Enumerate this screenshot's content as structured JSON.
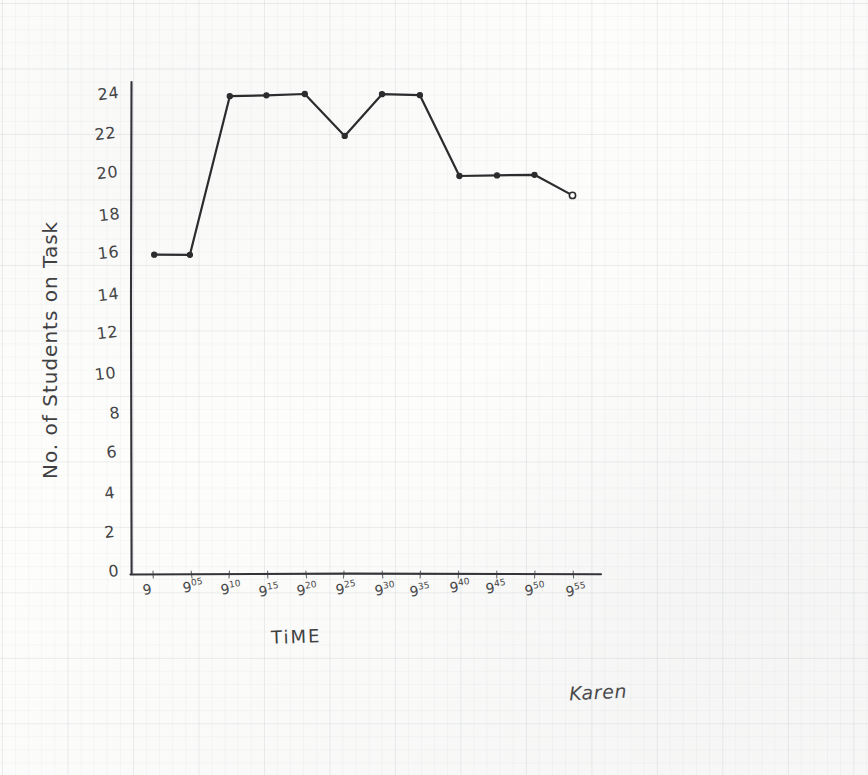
{
  "document": {
    "kind": "hand-drawn-graph-on-graph-paper",
    "signature": "Karen",
    "ink_color": "#2c2c2e",
    "paper_color": "#fdfdfc"
  },
  "chart_data": {
    "type": "line",
    "title": "",
    "xlabel": "TiME",
    "ylabel": "No. of Students on Task",
    "categories": [
      "9",
      "9:05",
      "9:10",
      "9:15",
      "9:20",
      "9:25",
      "9:30",
      "9:35",
      "9:40",
      "9:45",
      "9:50",
      "9:55"
    ],
    "x_tick_labels": [
      {
        "base": "9",
        "sup": ""
      },
      {
        "base": "9",
        "sup": "05"
      },
      {
        "base": "9",
        "sup": "10"
      },
      {
        "base": "9",
        "sup": "15"
      },
      {
        "base": "9",
        "sup": "20"
      },
      {
        "base": "9",
        "sup": "25"
      },
      {
        "base": "9",
        "sup": "30"
      },
      {
        "base": "9",
        "sup": "35"
      },
      {
        "base": "9",
        "sup": "40"
      },
      {
        "base": "9",
        "sup": "45"
      },
      {
        "base": "9",
        "sup": "50"
      },
      {
        "base": "9",
        "sup": "55"
      }
    ],
    "values": [
      16,
      16,
      24,
      24,
      24,
      22,
      24,
      24,
      20,
      20,
      20,
      19
    ],
    "y_tick_labels": [
      "0",
      "2",
      "4",
      "6",
      "8",
      "10",
      "12",
      "14",
      "16",
      "18",
      "20",
      "22",
      "24"
    ],
    "y_tick_values": [
      0,
      2,
      4,
      6,
      8,
      10,
      12,
      14,
      16,
      18,
      20,
      22,
      24
    ],
    "ylim": [
      0,
      24
    ],
    "xlim": [
      0,
      11
    ],
    "grid": "faint-graph-paper",
    "legend": "none",
    "marker": "filled-dot",
    "last_marker": "open-dot",
    "line_color": "#2c2c2e"
  },
  "geometry": {
    "origin_x": 131,
    "origin_y": 574,
    "x_first_tick": 153,
    "x_step": 38.2,
    "y_zero": 574,
    "y_per_unit": 19.95,
    "x_axis_right": 601,
    "y_axis_top": 82
  }
}
